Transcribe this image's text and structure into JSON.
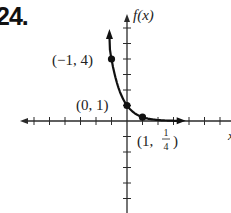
{
  "problem": {
    "number": "24."
  },
  "chart_data": {
    "type": "line",
    "title": "",
    "xlabel": "x",
    "ylabel": "f(x)",
    "function": "f(x) = (1/4)^x",
    "xlim": [
      -7,
      6.5
    ],
    "ylim": [
      -5.9,
      6.9
    ],
    "grid": false,
    "x_ticks": [
      -6,
      -5,
      -4,
      -3,
      -2,
      -1,
      1,
      2,
      3,
      4,
      5,
      6
    ],
    "y_ticks": [
      -5,
      -4,
      -3,
      -2,
      -1,
      1,
      2,
      3,
      4,
      5,
      6
    ],
    "series": [
      {
        "name": "f(x)",
        "x": [
          -1.1,
          -1,
          -0.75,
          -0.5,
          -0.25,
          0,
          0.25,
          0.5,
          0.75,
          1,
          1.5,
          2,
          2.5,
          3,
          3.4
        ],
        "y": [
          4.6,
          4,
          2.83,
          2,
          1.41,
          1,
          0.71,
          0.5,
          0.35,
          0.25,
          0.13,
          0.06,
          0.03,
          0.02,
          0.01
        ]
      }
    ],
    "labeled_points": [
      {
        "x": -1,
        "y": 4,
        "label": "(−1, 4)"
      },
      {
        "x": 0,
        "y": 1,
        "label": "(0, 1)"
      },
      {
        "x": 1,
        "y": 0.25,
        "label_prefix": "(1, ",
        "label_num": "1",
        "label_den": "4",
        "label_suffix": ")"
      }
    ]
  }
}
